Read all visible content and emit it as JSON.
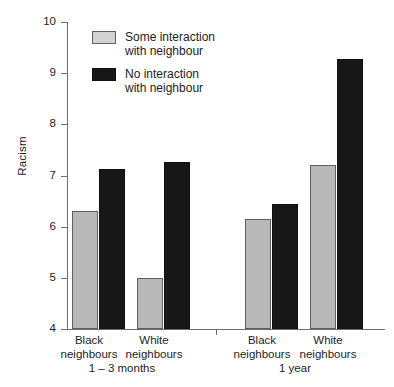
{
  "chart_data": {
    "type": "bar",
    "title": "",
    "xlabel": "",
    "ylabel": "Racism",
    "ylim": [
      4,
      10
    ],
    "yticks": [
      4,
      5,
      6,
      7,
      8,
      9,
      10
    ],
    "ytick_labels": [
      "4",
      "5",
      "6",
      "7",
      "8",
      "9",
      "10"
    ],
    "grid": false,
    "legend_position": "top-left",
    "categories": [
      "Black neighbours",
      "White neighbours",
      "Black neighbours",
      "White neighbours"
    ],
    "groups": [
      {
        "name": "1 – 3 months",
        "categories": [
          "Black neighbours",
          "White neighbours"
        ]
      },
      {
        "name": "1 year",
        "categories": [
          "Black neighbours",
          "White neighbours"
        ]
      }
    ],
    "series": [
      {
        "name": "Some interaction with neighbour",
        "color": "#b9b9b9",
        "values": [
          6.3,
          5.0,
          6.15,
          7.2
        ]
      },
      {
        "name": "No interaction with neighbour",
        "color": "#171717",
        "values": [
          7.12,
          7.26,
          6.45,
          9.28
        ]
      }
    ]
  },
  "legend": {
    "items": [
      {
        "label": "Some interaction\nwith neighbour",
        "swatch": "some"
      },
      {
        "label": "No interaction\nwith neighbour",
        "swatch": "none"
      }
    ]
  },
  "axes": {
    "y_title": "Racism",
    "y_labels": [
      "10",
      "9",
      "8",
      "7",
      "6",
      "5",
      "4"
    ]
  },
  "x_labels": {
    "cat0": "Black\nneighbours",
    "cat1": "White\nneighbours",
    "cat2": "Black\nneighbours",
    "cat3": "White\nneighbours",
    "group0": "1 – 3 months",
    "group1": "1 year"
  },
  "colors": {
    "some_interaction": "#b9b9b9",
    "no_interaction": "#171717",
    "axis": "#6e6e6e",
    "text": "#1d1d1d",
    "background": "#ffffff"
  }
}
